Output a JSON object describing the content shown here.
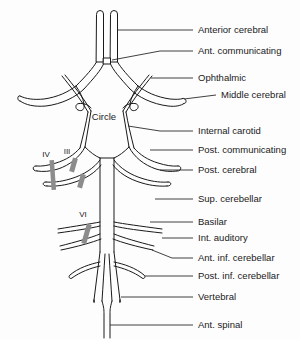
{
  "diagram": {
    "title_inner": "Circle",
    "nerve_markers": [
      {
        "id": "nerve-iv",
        "label": "IV"
      },
      {
        "id": "nerve-iii",
        "label": "III"
      },
      {
        "id": "nerve-vi",
        "label": "VI"
      }
    ],
    "labels": [
      {
        "id": "anterior-cerebral",
        "text": "Anterior cerebral"
      },
      {
        "id": "ant-communicating",
        "text": "Ant. communicating"
      },
      {
        "id": "ophthalmic",
        "text": "Ophthalmic"
      },
      {
        "id": "middle-cerebral",
        "text": "Middle cerebral"
      },
      {
        "id": "internal-carotid",
        "text": "Internal carotid"
      },
      {
        "id": "post-communicating",
        "text": "Post. communicating"
      },
      {
        "id": "post-cerebral",
        "text": "Post. cerebral"
      },
      {
        "id": "sup-cerebellar",
        "text": "Sup. cerebellar"
      },
      {
        "id": "basilar",
        "text": "Basilar"
      },
      {
        "id": "int-auditory",
        "text": "Int. auditory"
      },
      {
        "id": "ant-inf-cerebellar",
        "text": "Ant. inf. cerebellar"
      },
      {
        "id": "post-inf-cerebellar",
        "text": "Post. inf. cerebellar"
      },
      {
        "id": "vertebral",
        "text": "Vertebral"
      },
      {
        "id": "ant-spinal",
        "text": "Ant. spinal"
      }
    ],
    "colors": {
      "stroke": "#1a1a1a",
      "leader": "#2b2b2b",
      "nerve": "#8c8c8c",
      "background": "#fdfdfd"
    }
  }
}
